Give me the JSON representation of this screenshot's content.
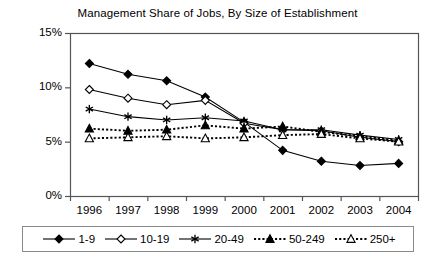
{
  "chart_data": {
    "type": "line",
    "title": "Management Share of Jobs, By Size of Establishment",
    "xlabel": "",
    "ylabel": "",
    "categories": [
      "1996",
      "1997",
      "1998",
      "1999",
      "2000",
      "2001",
      "2002",
      "2003",
      "2004"
    ],
    "x": [
      1996,
      1997,
      1998,
      1999,
      2000,
      2001,
      2002,
      2003,
      2004
    ],
    "ylim": [
      0,
      15
    ],
    "yticks": [
      0,
      5,
      10,
      15
    ],
    "ytick_labels": [
      "0%",
      "5%",
      "10%",
      "15%"
    ],
    "grid": false,
    "legend_position": "bottom",
    "series": [
      {
        "name": "1-9",
        "marker": "filled-diamond",
        "line_style": "solid",
        "color": "#000000",
        "values": [
          12.2,
          11.2,
          10.6,
          9.1,
          6.8,
          4.2,
          3.2,
          2.8,
          3.0
        ]
      },
      {
        "name": "10-19",
        "marker": "open-diamond",
        "line_style": "solid",
        "color": "#000000",
        "values": [
          9.8,
          9.0,
          8.4,
          8.8,
          6.7,
          6.1,
          6.0,
          5.4,
          5.0
        ]
      },
      {
        "name": "20-49",
        "marker": "asterisk",
        "line_style": "solid",
        "color": "#000000",
        "values": [
          8.0,
          7.3,
          7.0,
          7.2,
          6.9,
          6.1,
          6.1,
          5.6,
          5.2
        ]
      },
      {
        "name": "50-249",
        "marker": "filled-triangle",
        "line_style": "dotted",
        "color": "#000000",
        "values": [
          6.2,
          6.0,
          6.1,
          6.5,
          6.2,
          6.4,
          5.9,
          5.5,
          5.1
        ]
      },
      {
        "name": "250+",
        "marker": "open-triangle",
        "line_style": "dotted",
        "color": "#000000",
        "values": [
          5.3,
          5.4,
          5.5,
          5.3,
          5.4,
          5.6,
          5.7,
          5.3,
          5.0
        ]
      }
    ]
  },
  "axes": {
    "frame_color": "#555555",
    "tick_color": "#555555"
  }
}
